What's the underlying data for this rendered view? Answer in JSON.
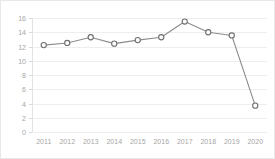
{
  "chart_data": {
    "type": "line",
    "title": "",
    "xlabel": "",
    "ylabel": "",
    "categories": [
      "2011",
      "2012",
      "2013",
      "2014",
      "2015",
      "2016",
      "2017",
      "2018",
      "2019",
      "2020"
    ],
    "values": [
      12.2,
      12.5,
      13.3,
      12.4,
      12.9,
      13.3,
      15.5,
      14.0,
      13.55,
      3.7
    ],
    "series": [
      {
        "name": "series-1",
        "values": [
          12.2,
          12.5,
          13.3,
          12.4,
          12.9,
          13.3,
          15.5,
          14.0,
          13.55,
          3.7
        ]
      }
    ],
    "ylim": [
      0,
      16
    ],
    "yticks": [
      0,
      2,
      4,
      6,
      8,
      10,
      12,
      14,
      16
    ],
    "ytick_labels": [
      "0",
      "2",
      "4",
      "6",
      "8",
      "10",
      "12",
      "14",
      "16"
    ],
    "xtick_labels": [
      "2011",
      "2012",
      "2013",
      "2014",
      "2015",
      "2016",
      "2017",
      "2018",
      "2019",
      "2020"
    ],
    "grid": true,
    "legend": "none",
    "marker": "open-circle",
    "line_color": "#8c8c8c",
    "marker_fill": "#ffffff",
    "marker_stroke": "#6e6e6e",
    "grid_color": "#eceef0",
    "tick_label_color": "#a6a6a6",
    "background_color": "#ffffff",
    "border_color": "#e8e8e8"
  }
}
